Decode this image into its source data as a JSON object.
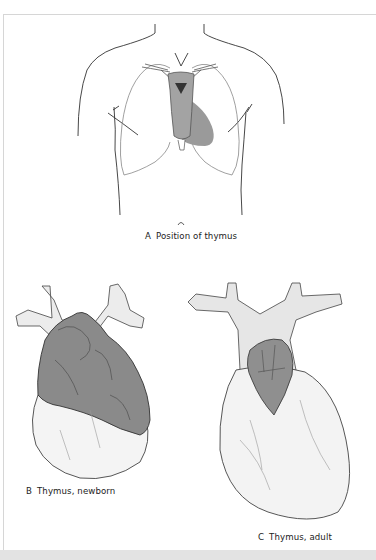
{
  "figure": {
    "panels": [
      {
        "id": "A",
        "letter": "A",
        "caption": "Position of thymus"
      },
      {
        "id": "B",
        "letter": "B",
        "caption": "Thymus, newborn"
      },
      {
        "id": "C",
        "letter": "C",
        "caption": "Thymus, adult"
      }
    ]
  },
  "colors": {
    "thymus_gray": "#9a9a9a",
    "thymus_dark": "#7d7d7d",
    "outline": "#333333",
    "frame": "#d6d6d6",
    "bottom_band": "#e3e3e3"
  }
}
